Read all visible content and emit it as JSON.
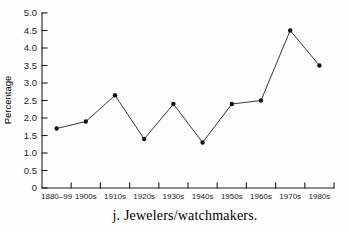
{
  "figure": {
    "background_color": "#fdfdfc",
    "ink_color": "#1f1f1f",
    "line_color": "#3a3a3a",
    "marker_color": "#111111"
  },
  "chart_data": {
    "type": "line",
    "title": "",
    "caption": "j. Jewelers/watchmakers.",
    "xlabel": "",
    "ylabel": "Percentage",
    "categories": [
      "1880–99",
      "1900s",
      "1910s",
      "1920s",
      "1930s",
      "1940s",
      "1950s",
      "1960s",
      "1970s",
      "1980s"
    ],
    "series": [
      {
        "name": "Jewelers/watchmakers",
        "values": [
          1.7,
          1.9,
          2.65,
          1.4,
          2.4,
          1.3,
          2.4,
          2.5,
          4.5,
          3.5
        ]
      }
    ],
    "ylim": [
      0,
      5.0
    ],
    "ytick_step": 0.5,
    "ytick_labels": [
      "0",
      "0.5",
      "1.0",
      "1.5",
      "2.0",
      "2.5",
      "3.0",
      "3.5",
      "4.0",
      "4.5",
      "5.0"
    ],
    "grid": false,
    "legend_position": "none",
    "marker": "filled-dot",
    "x_tick_position": "category-boundaries"
  }
}
